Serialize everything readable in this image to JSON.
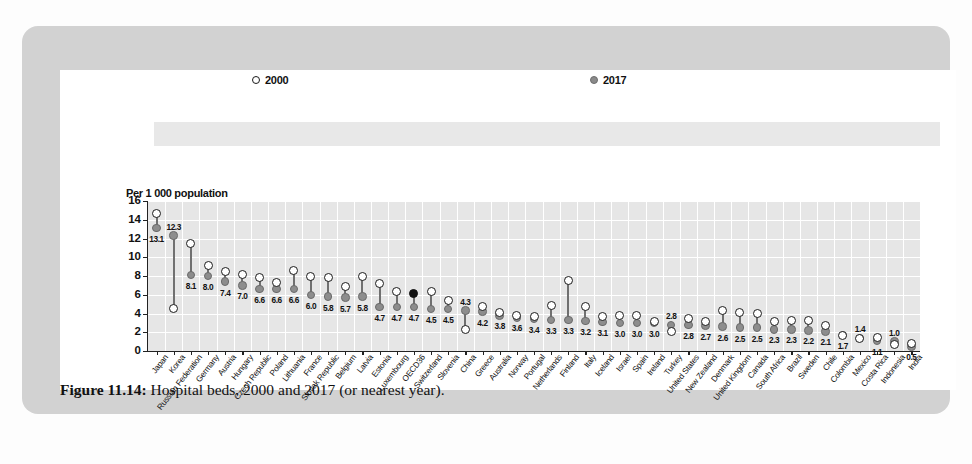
{
  "figure": {
    "caption_label": "Figure 11.14:",
    "caption_text": " Hospital beds, 2000 and 2017 (or nearest year)."
  },
  "legend": {
    "series_2000": "2000",
    "series_2017": "2017"
  },
  "colors": {
    "card": "#d2d2d2",
    "panel": "#ffffff",
    "plot_background": "#e6e6e6",
    "gridline": "#ffffff",
    "marker_2017": "#8d8d8d",
    "marker_2000_outline": "#1b1b1b",
    "highlight_marker": "#111111",
    "legend_band": "#e8e8e8"
  },
  "chart_data": {
    "type": "scatter",
    "title": "Hospital beds, 2000 and 2017 (or nearest year)",
    "ylabel": "Per 1 000 population",
    "xlabel": "",
    "ylim": [
      0,
      16
    ],
    "yticks": [
      0,
      2,
      4,
      6,
      8,
      10,
      12,
      14,
      16
    ],
    "grid": true,
    "legend_position": "top",
    "highlight_category": "OECD36",
    "categories": [
      "Japan",
      "Korea",
      "Russian Federation",
      "Germany",
      "Austria",
      "Hungary",
      "Czech Republic",
      "Poland",
      "Lithuania",
      "France",
      "Slovak Republic",
      "Belgium",
      "Latvia",
      "Estonia",
      "Luxembourg",
      "OECD36",
      "Switzerland",
      "Slovenia",
      "China",
      "Greece",
      "Australia",
      "Norway",
      "Portugal",
      "Netherlands",
      "Finland",
      "Italy",
      "Iceland",
      "Israel",
      "Spain",
      "Ireland",
      "Turkey",
      "United States",
      "New Zealand",
      "Denmark",
      "United Kingdom",
      "Canada",
      "South Africa",
      "Brazil",
      "Sweden",
      "Chile",
      "Colombia",
      "Mexico",
      "Costa Rica",
      "Indonesia",
      "India"
    ],
    "series": [
      {
        "name": "2017",
        "values": [
          13.1,
          12.3,
          8.1,
          8.0,
          7.4,
          7.0,
          6.6,
          6.6,
          6.6,
          6.0,
          5.8,
          5.7,
          5.8,
          4.7,
          4.7,
          4.7,
          4.5,
          4.5,
          4.3,
          4.2,
          3.8,
          3.6,
          3.4,
          3.3,
          3.3,
          3.2,
          3.1,
          3.0,
          3.0,
          3.0,
          2.8,
          2.8,
          2.7,
          2.6,
          2.5,
          2.5,
          2.3,
          2.3,
          2.2,
          2.1,
          1.7,
          1.4,
          1.1,
          1.0,
          0.5
        ]
      },
      {
        "name": "2000",
        "values": [
          14.7,
          4.5,
          11.5,
          9.1,
          8.5,
          8.2,
          7.8,
          7.3,
          8.6,
          8.0,
          7.8,
          6.9,
          8.0,
          7.2,
          6.3,
          6.1,
          6.3,
          5.4,
          2.3,
          4.7,
          4.1,
          3.8,
          3.7,
          4.9,
          7.5,
          4.7,
          3.7,
          3.8,
          3.8,
          3.2,
          2.1,
          3.5,
          3.1,
          4.3,
          4.1,
          4.0,
          3.1,
          3.3,
          3.3,
          2.7,
          1.7,
          1.3,
          1.4,
          0.7,
          0.8
        ]
      }
    ]
  }
}
